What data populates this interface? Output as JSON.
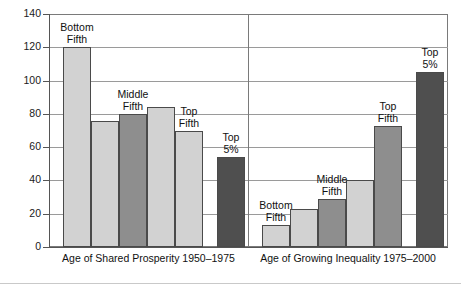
{
  "chart_data": {
    "type": "bar",
    "title": "",
    "xlabel": "",
    "ylabel": "",
    "ylim": [
      0,
      140
    ],
    "yticks": [
      0,
      20,
      40,
      60,
      80,
      100,
      120,
      140
    ],
    "grid": true,
    "legend": false,
    "groups": [
      {
        "caption": "Age of Shared Prosperity 1950–1975",
        "categories": [
          "Bottom Fifth",
          "Second Fifth",
          "Middle Fifth",
          "Fourth Fifth",
          "Top Fifth",
          "Top 5%"
        ],
        "values": [
          120,
          76,
          80,
          84,
          70,
          54
        ],
        "labels": [
          {
            "line1": "Bottom",
            "line2": "Fifth"
          },
          {
            "line1": "",
            "line2": ""
          },
          {
            "line1": "Middle",
            "line2": "Fifth"
          },
          {
            "line1": "",
            "line2": ""
          },
          {
            "line1": "Top",
            "line2": "Fifth"
          },
          {
            "line1": "Top",
            "line2": "5%"
          }
        ],
        "fills": [
          "light",
          "light",
          "mid",
          "light",
          "light",
          "dark"
        ]
      },
      {
        "caption": "Age of Growing Inequality 1975–2000",
        "categories": [
          "Bottom Fifth",
          "Second Fifth",
          "Middle Fifth",
          "Fourth Fifth",
          "Top Fifth",
          "Top 5%"
        ],
        "values": [
          13,
          23,
          29,
          40,
          73,
          105
        ],
        "labels": [
          {
            "line1": "Bottom",
            "line2": "Fifth"
          },
          {
            "line1": "",
            "line2": ""
          },
          {
            "line1": "Middle",
            "line2": "Fifth"
          },
          {
            "line1": "",
            "line2": ""
          },
          {
            "line1": "Top",
            "line2": "Fifth"
          },
          {
            "line1": "Top",
            "line2": "5%"
          }
        ],
        "fills": [
          "light",
          "light",
          "mid",
          "light",
          "mid",
          "dark"
        ]
      }
    ],
    "colors": {
      "light": "#d2d2d2",
      "mid": "#8e8e8e",
      "dark": "#4f4f4f",
      "axis": "#555555",
      "grid": "#9a9a9a",
      "text": "#111111"
    }
  }
}
